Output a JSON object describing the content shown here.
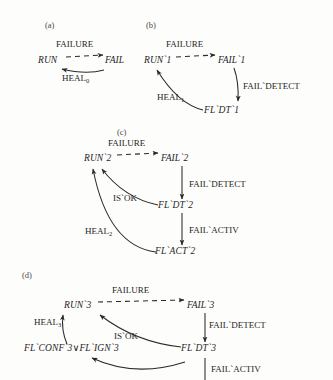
{
  "figure": {
    "type": "state-transition-diagram",
    "background_color": "#fdfdfc",
    "text_color": "#1f1f1f"
  },
  "panels": [
    {
      "id": "a",
      "label": "(a)",
      "nodes": [
        {
          "id": "run0",
          "text": "RUN",
          "x": 38,
          "y": 62
        },
        {
          "id": "fail0",
          "text": "FAIL",
          "x": 108,
          "y": 62
        }
      ],
      "edges": [
        {
          "from": "run0",
          "to": "fail0",
          "label": "FAILURE",
          "style": "dashed",
          "label_x": 56,
          "label_y": 46
        },
        {
          "from": "fail0",
          "to": "run0",
          "label": "HEAL",
          "sublabel": "0",
          "style": "solid",
          "label_x": 62,
          "label_y": 80
        }
      ]
    },
    {
      "id": "b",
      "label": "(b)",
      "nodes": [
        {
          "id": "run1",
          "text": "RUN`1",
          "x": 146,
          "y": 62
        },
        {
          "id": "fail1",
          "text": "FAIL`1",
          "x": 222,
          "y": 62
        },
        {
          "id": "fldt1",
          "text": "FL`DT`1",
          "x": 206,
          "y": 112
        }
      ],
      "edges": [
        {
          "from": "run1",
          "to": "fail1",
          "label": "FAILURE",
          "style": "dashed",
          "label_x": 168,
          "label_y": 46
        },
        {
          "from": "fail1",
          "to": "fldt1",
          "label": "FAIL`DETECT",
          "style": "solid",
          "label_x": 243,
          "label_y": 88
        },
        {
          "from": "fldt1",
          "to": "run1",
          "label": "HEAL",
          "sublabel": "1",
          "style": "solid",
          "label_x": 159,
          "label_y": 99
        }
      ]
    },
    {
      "id": "c",
      "label": "(c)",
      "nodes": [
        {
          "id": "run2",
          "text": "RUN`2",
          "x": 86,
          "y": 160
        },
        {
          "id": "fail2",
          "text": "FAIL`2",
          "x": 165,
          "y": 160
        },
        {
          "id": "fldt2",
          "text": "FL`DT`2",
          "x": 160,
          "y": 207
        },
        {
          "id": "flact2",
          "text": "FL`ACT`2",
          "x": 159,
          "y": 253
        }
      ],
      "edges": [
        {
          "from": "run2",
          "to": "fail2",
          "label": "FAILURE",
          "style": "dashed",
          "label_x": 110,
          "label_y": 145
        },
        {
          "from": "fail2",
          "to": "fldt2",
          "label": "FAIL`DETECT",
          "style": "solid",
          "label_x": 190,
          "label_y": 186
        },
        {
          "from": "fldt2",
          "to": "run2",
          "label": "IS`OK",
          "style": "solid",
          "label_x": 116,
          "label_y": 200
        },
        {
          "from": "fldt2",
          "to": "flact2",
          "label": "FAIL`ACTIV",
          "style": "solid",
          "label_x": 190,
          "label_y": 232
        },
        {
          "from": "flact2",
          "to": "run2",
          "label": "HEAL",
          "sublabel": "2",
          "style": "solid",
          "label_x": 88,
          "label_y": 233
        }
      ]
    },
    {
      "id": "d",
      "label": "(d)",
      "nodes": [
        {
          "id": "run3",
          "text": "RUN`3",
          "x": 66,
          "y": 307
        },
        {
          "id": "fail3",
          "text": "FAIL`3",
          "x": 191,
          "y": 307
        },
        {
          "id": "fldt3",
          "text": "FL`DT`3",
          "x": 183,
          "y": 350
        },
        {
          "id": "flconf3",
          "text": "FL`CONF`3∨FL`IGN`3",
          "x": 26,
          "y": 350
        }
      ],
      "edges": [
        {
          "from": "run3",
          "to": "fail3",
          "label": "FAILURE",
          "style": "dashed",
          "label_x": 113,
          "label_y": 292
        },
        {
          "from": "fail3",
          "to": "fldt3",
          "label": "FAIL`DETECT",
          "style": "solid",
          "label_x": 209,
          "label_y": 327
        },
        {
          "from": "fldt3",
          "to": "run3",
          "label": "IS`OK",
          "style": "solid",
          "label_x": 117,
          "label_y": 338
        },
        {
          "from": "fldt3",
          "to": "flconf3",
          "label": "",
          "style": "solid",
          "label_x": 0,
          "label_y": 0
        },
        {
          "from": "flconf3",
          "to": "run3",
          "label": "HEAL",
          "sublabel": "3",
          "style": "solid",
          "label_x": 37,
          "label_y": 324
        },
        {
          "from": "fldt3",
          "to": "below",
          "label": "FAIL`ACTIV",
          "style": "solid",
          "label_x": 211,
          "label_y": 371
        }
      ]
    }
  ]
}
